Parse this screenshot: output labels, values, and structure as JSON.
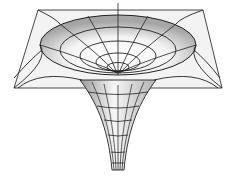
{
  "figure": {
    "colors": {
      "background": "#ffffff",
      "plane_fill": "#f2f2f2",
      "line": "#222222",
      "shade_dark": "#a8a8a8",
      "shade_light": "#ffffff"
    }
  }
}
